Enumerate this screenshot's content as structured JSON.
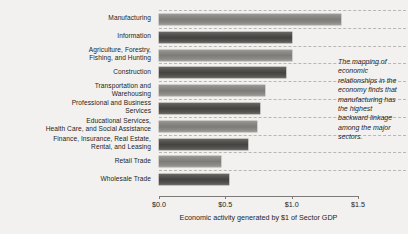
{
  "chart_data": {
    "type": "bar",
    "orientation": "horizontal",
    "title": "",
    "xlabel": "Economic activity generated by $1 of Sector GDP",
    "ylabel": "",
    "xlim": [
      0.0,
      1.5
    ],
    "xticks": [
      "$0.0",
      "$0.5",
      "$1.0",
      "$1.5"
    ],
    "xtick_values": [
      0.0,
      0.5,
      1.0,
      1.5
    ],
    "grid": true,
    "grid_axis": "y",
    "legend": "none",
    "categories": [
      "Manufacturing",
      "Information",
      "Agriculture, Forestry,\nFishing, and Hunting",
      "Construction",
      "Transportation and\nWarehousing",
      "Professional and Business\nServices",
      "Educational Services,\nHealth Care, and Social Assistance",
      "Finance, Insurance, Real Estate,\nRental, and Leasing",
      "Retail Trade",
      "Wholesale Trade"
    ],
    "values": [
      1.37,
      1.0,
      1.0,
      0.96,
      0.8,
      0.76,
      0.74,
      0.67,
      0.47,
      0.53
    ],
    "annotation": "The mapping of economic relationships in the economy finds that manufacturing has the highest backward linkage among the major sectors.",
    "colors": {
      "background": "#f2f1ef",
      "bar_light": "#8e8c88",
      "bar_dark": "#4a4947",
      "gridline": "#b9b7b3",
      "axis": "#7d7b78",
      "text": "#1d1d1b"
    }
  },
  "categories_display": [
    {
      "line1": "Manufacturing",
      "line2": ""
    },
    {
      "line1": "Information",
      "line2": ""
    },
    {
      "line1": "Agriculture, Forestry,",
      "line2": "Fishing, and Hunting"
    },
    {
      "line1": "Construction",
      "line2": ""
    },
    {
      "line1": "Transportation and",
      "line2": "Warehousing"
    },
    {
      "line1": "Professional and Business",
      "line2": "Services"
    },
    {
      "line1": "Educational Services,",
      "line2": "Health Care, and Social Assistance"
    },
    {
      "line1": "Finance, Insurance, Real Estate,",
      "line2": "Rental, and Leasing"
    },
    {
      "line1": "Retail Trade",
      "line2": ""
    },
    {
      "line1": "Wholesale Trade",
      "line2": ""
    }
  ]
}
